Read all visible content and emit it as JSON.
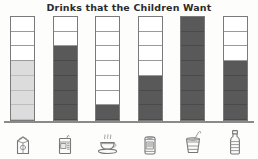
{
  "chart": {
    "title": "Drinks that the Children Want"
  },
  "chart_data": {
    "type": "bar",
    "title": "Drinks that the Children Want",
    "xlabel": "",
    "ylabel": "",
    "ylim": [
      0,
      7
    ],
    "grid": true,
    "grid_cells_per_bar": 7,
    "legend": "none",
    "tick_labels": [],
    "categories": [
      "milk carton",
      "juice box",
      "cup of tea",
      "soda can",
      "milkshake cup with straw",
      "water bottle"
    ],
    "values": [
      4,
      5,
      1,
      3,
      7,
      4
    ],
    "bar_colors": [
      "#dcdcdc",
      "#595959",
      "#595959",
      "#595959",
      "#595959",
      "#595959"
    ],
    "annotations": []
  },
  "bars": [
    {
      "category": "milk carton",
      "icon": "milk-carton-icon",
      "value": 4,
      "total_cells": 7,
      "fill_style": "light",
      "color": "#dcdcdc"
    },
    {
      "category": "juice box",
      "icon": "juice-box-icon",
      "value": 5,
      "total_cells": 7,
      "fill_style": "dark",
      "color": "#595959"
    },
    {
      "category": "cup of tea",
      "icon": "teacup-icon",
      "value": 1,
      "total_cells": 7,
      "fill_style": "dark",
      "color": "#595959"
    },
    {
      "category": "soda can",
      "icon": "soda-can-icon",
      "value": 3,
      "total_cells": 7,
      "fill_style": "dark",
      "color": "#595959"
    },
    {
      "category": "milkshake cup with straw",
      "icon": "cup-with-straw-icon",
      "value": 7,
      "total_cells": 7,
      "fill_style": "dark",
      "color": "#595959"
    },
    {
      "category": "water bottle",
      "icon": "water-bottle-icon",
      "value": 4,
      "total_cells": 7,
      "fill_style": "dark",
      "color": "#595959"
    }
  ],
  "colors": {
    "dark_fill": "#595959",
    "light_fill": "#dcdcdc",
    "outline": "#7a7a7a",
    "axis": "#8a8a8a",
    "title": "#2b2b2b",
    "background": "#fdfdfc"
  }
}
